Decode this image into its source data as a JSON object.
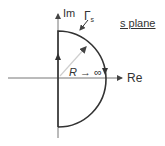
{
  "diagram": {
    "title": "s plane",
    "axes": {
      "vertical_label": "Im",
      "horizontal_label": "Re"
    },
    "contour_label": "Γ",
    "contour_label_sub": "s",
    "radius_label": "R → ∞",
    "colors": {
      "contour": "#333333",
      "axis": "#555555",
      "radius": "#c8c8c8",
      "text": "#333333"
    }
  }
}
